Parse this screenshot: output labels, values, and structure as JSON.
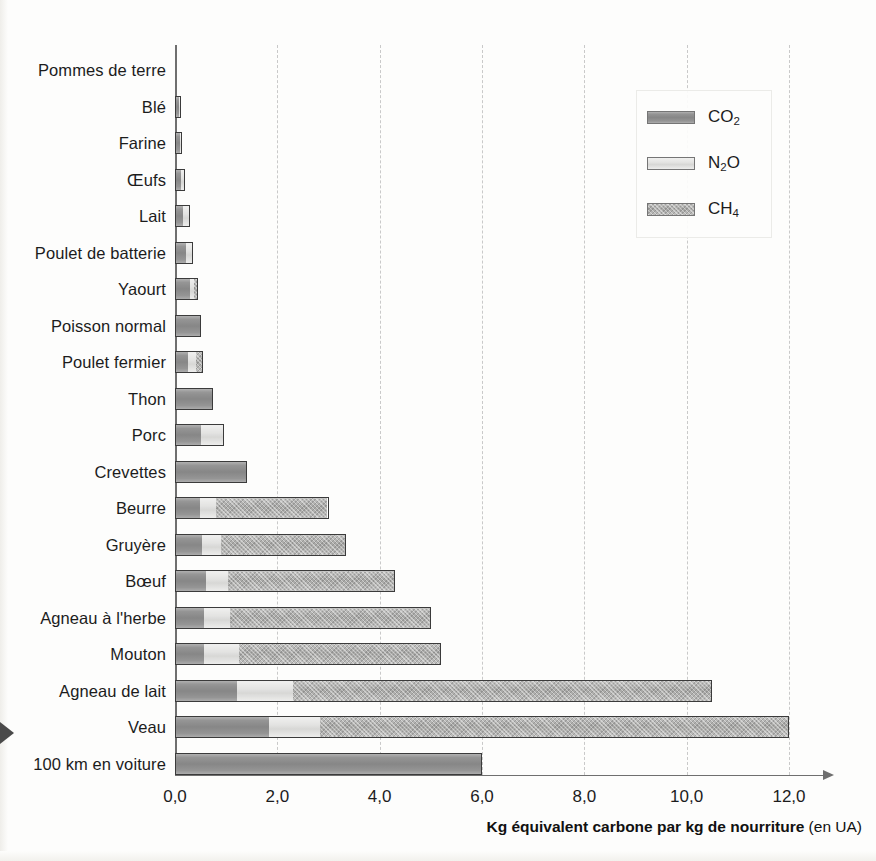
{
  "chart_data": {
    "type": "bar",
    "orientation": "horizontal",
    "stacked": true,
    "title": "",
    "xlabel": "Kg équivalent carbone par kg de nourriture (en UA)",
    "xlabel_unit": "(en UA)",
    "xlabel_main": "Kg équivalent carbone par kg de nourriture",
    "ylabel": "",
    "xlim": [
      0.0,
      12.0
    ],
    "xticks": [
      0.0,
      2.0,
      4.0,
      6.0,
      8.0,
      10.0,
      12.0
    ],
    "xticklabels": [
      "0,0",
      "2,0",
      "4,0",
      "6,0",
      "8,0",
      "10,0",
      "12,0"
    ],
    "grid": "vertical-dashed",
    "legend_position": "top-right",
    "categories": [
      "Pommes de terre",
      "Blé",
      "Farine",
      "Œufs",
      "Lait",
      "Poulet de batterie",
      "Yaourt",
      "Poisson normal",
      "Poulet fermier",
      "Thon",
      "Porc",
      "Crevettes",
      "Beurre",
      "Gruyère",
      "Bœuf",
      "Agneau à l'herbe",
      "Mouton",
      "Agneau de lait",
      "Veau",
      "100 km en voiture"
    ],
    "series": [
      {
        "name": "CO2",
        "label": "CO",
        "sub": "2",
        "color": "#8f8f8f",
        "values": [
          0.0,
          0.1,
          0.11,
          0.12,
          0.16,
          0.22,
          0.3,
          0.5,
          0.25,
          0.75,
          0.5,
          1.4,
          0.48,
          0.52,
          0.6,
          0.55,
          0.55,
          1.2,
          1.82,
          6.0
        ]
      },
      {
        "name": "N2O",
        "label": "N",
        "sub": "2",
        "label_tail": "O",
        "color": "#dededc",
        "values": [
          0.0,
          0.02,
          0.02,
          0.07,
          0.14,
          0.13,
          0.08,
          0.0,
          0.18,
          0.0,
          0.45,
          0.0,
          0.32,
          0.38,
          0.42,
          0.52,
          0.7,
          1.1,
          1.0,
          0.0
        ]
      },
      {
        "name": "CH4",
        "label": "CH",
        "sub": "4",
        "color": "#a5a5a3",
        "values": [
          0.0,
          0.0,
          0.0,
          0.0,
          0.0,
          0.0,
          0.07,
          0.0,
          0.12,
          0.0,
          0.0,
          0.0,
          2.2,
          2.45,
          3.28,
          3.93,
          3.95,
          8.2,
          9.18,
          0.0
        ]
      }
    ],
    "totals": [
      0.0,
      0.12,
      0.13,
      0.19,
      0.3,
      0.35,
      0.45,
      0.5,
      0.55,
      0.75,
      0.95,
      1.4,
      3.0,
      3.35,
      4.3,
      5.0,
      5.2,
      10.5,
      12.0,
      6.0
    ]
  },
  "legend": {
    "items": [
      {
        "name": "CO2",
        "label_main": "CO",
        "label_sub": "2",
        "label_tail": ""
      },
      {
        "name": "N2O",
        "label_main": "N",
        "label_sub": "2",
        "label_tail": "O"
      },
      {
        "name": "CH4",
        "label_main": "CH",
        "label_sub": "4",
        "label_tail": ""
      }
    ]
  }
}
